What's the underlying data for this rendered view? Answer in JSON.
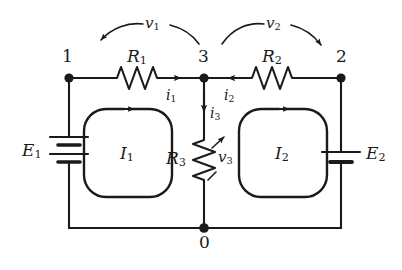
{
  "diagram": {
    "stroke_color": "#1a1a1a",
    "nodes": [
      {
        "id": "node-1",
        "label": "1",
        "x": 69,
        "y": 78
      },
      {
        "id": "node-3",
        "label": "3",
        "x": 204,
        "y": 78
      },
      {
        "id": "node-2",
        "label": "2",
        "x": 341,
        "y": 78
      },
      {
        "id": "node-0",
        "label": "0",
        "x": 204,
        "y": 228
      }
    ],
    "resistors": [
      {
        "id": "R1",
        "symbol": "R",
        "subscript": "1",
        "orientation": "horizontal"
      },
      {
        "id": "R2",
        "symbol": "R",
        "subscript": "2",
        "orientation": "horizontal"
      },
      {
        "id": "R3",
        "symbol": "R",
        "subscript": "3",
        "orientation": "vertical"
      }
    ],
    "sources": [
      {
        "id": "E1",
        "symbol": "E",
        "subscript": "1",
        "type": "battery-multicell",
        "plates": 4
      },
      {
        "id": "E2",
        "symbol": "E",
        "subscript": "2",
        "type": "battery-cell",
        "plates": 2
      }
    ],
    "currents": [
      {
        "id": "i1",
        "symbol": "i",
        "subscript": "1",
        "direction": "right"
      },
      {
        "id": "i2",
        "symbol": "i",
        "subscript": "2",
        "direction": "left"
      },
      {
        "id": "i3",
        "symbol": "i",
        "subscript": "3",
        "direction": "down"
      }
    ],
    "voltages": [
      {
        "id": "v1",
        "symbol": "v",
        "subscript": "1",
        "arc_direction": "left"
      },
      {
        "id": "v2",
        "symbol": "v",
        "subscript": "2",
        "arc_direction": "right"
      },
      {
        "id": "v3",
        "symbol": "v",
        "subscript": "3",
        "arc_direction": "up"
      }
    ],
    "meshes": [
      {
        "id": "I1",
        "symbol": "I",
        "subscript": "1",
        "direction": "clockwise"
      },
      {
        "id": "I2",
        "symbol": "I",
        "subscript": "2",
        "direction": "clockwise"
      }
    ]
  }
}
